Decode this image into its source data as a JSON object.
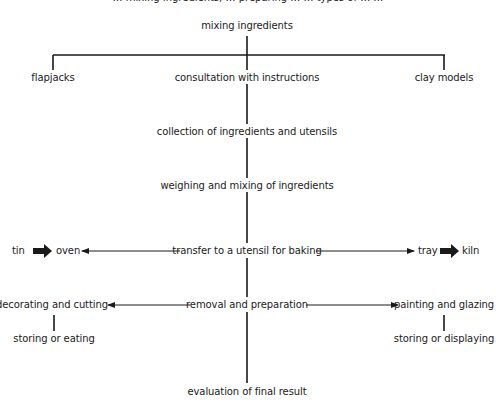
{
  "header": {
    "cut_off_title": "… mixing ingredients, … preparing … … types of … …"
  },
  "diagram": {
    "root": "mixing ingredients",
    "branch_left": "flapjacks",
    "branch_center": "consultation with instructions",
    "branch_right": "clay models",
    "steps": [
      "collection of ingredients and utensils",
      "weighing and mixing of ingredients",
      "transfer to a utensil for baking",
      "removal and preparation",
      "evaluation of final result"
    ],
    "transfer_left": {
      "from": "tin",
      "to": "oven"
    },
    "transfer_right": {
      "from": "tray",
      "to": "kiln"
    },
    "removal_left": "decorating and cutting",
    "removal_left_after": "storing or eating",
    "removal_right": "painting and glazing",
    "removal_right_after": "storing or displaying"
  }
}
